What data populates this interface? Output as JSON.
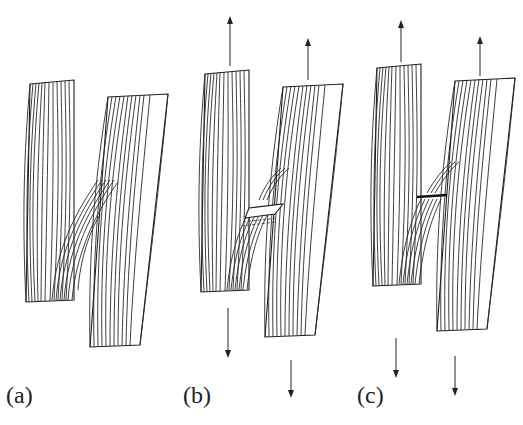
{
  "figure": {
    "panels": [
      {
        "id": "a",
        "label": "(a)",
        "state": "unloaded",
        "arrows": false,
        "bridge_defect": "none"
      },
      {
        "id": "b",
        "label": "(b)",
        "state": "tensile load",
        "arrows": true,
        "bridge_defect": "crack with dashed separation band"
      },
      {
        "id": "c",
        "label": "(c)",
        "state": "tensile load",
        "arrows": true,
        "bridge_defect": "fracture at bridge"
      }
    ],
    "colors": {
      "line": "#1e1e1e",
      "background": "#ffffff"
    }
  }
}
